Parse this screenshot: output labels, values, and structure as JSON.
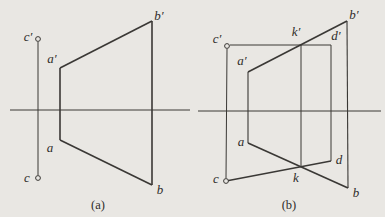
{
  "background": "#e9e7e3",
  "ink": "#3a3835",
  "figures": {
    "a": {
      "caption": "(a)",
      "lines": [
        {
          "name": "axis-x",
          "x1": 10,
          "y1": 110,
          "x2": 190,
          "y2": 110,
          "w": 1
        },
        {
          "name": "projection-line-c-c-prime",
          "x1": 38,
          "y1": 42,
          "x2": 38,
          "y2": 175,
          "w": 1
        },
        {
          "name": "edge-a-prime-b-prime",
          "x1": 60,
          "y1": 68,
          "x2": 152,
          "y2": 21,
          "w": 1.6
        },
        {
          "name": "edge-b-prime-b",
          "x1": 152,
          "y1": 21,
          "x2": 152,
          "y2": 185,
          "w": 1.6
        },
        {
          "name": "edge-a-b",
          "x1": 60,
          "y1": 140,
          "x2": 152,
          "y2": 185,
          "w": 1.6
        },
        {
          "name": "edge-a-a-prime",
          "x1": 60,
          "y1": 68,
          "x2": 60,
          "y2": 140,
          "w": 1.6
        }
      ],
      "circles": [
        {
          "name": "point-c-prime",
          "cx": 38,
          "cy": 39,
          "r": 2.4
        },
        {
          "name": "point-c",
          "cx": 38,
          "cy": 178,
          "r": 2.4
        }
      ],
      "labels": [
        {
          "name": "label-c-prime",
          "text": "c′",
          "x": 28,
          "y": 36
        },
        {
          "name": "label-a-prime",
          "text": "a′",
          "x": 52,
          "y": 58
        },
        {
          "name": "label-b-prime",
          "text": "b′",
          "x": 159,
          "y": 15
        },
        {
          "name": "label-a",
          "text": "a",
          "x": 50,
          "y": 147
        },
        {
          "name": "label-c",
          "text": "c",
          "x": 27,
          "y": 177
        },
        {
          "name": "label-b",
          "text": "b",
          "x": 160,
          "y": 189
        }
      ]
    },
    "b": {
      "caption": "(b)",
      "lines": [
        {
          "name": "axis-x",
          "x1": 198,
          "y1": 111,
          "x2": 381,
          "y2": 111,
          "w": 1
        },
        {
          "name": "projection-line-c-c-prime",
          "x1": 227,
          "y1": 49,
          "x2": 226,
          "y2": 178,
          "w": 1
        },
        {
          "name": "line-c-prime-d-prime",
          "x1": 230,
          "y1": 45,
          "x2": 331,
          "y2": 45,
          "w": 1
        },
        {
          "name": "edge-a-prime-b-prime",
          "x1": 248,
          "y1": 72,
          "x2": 347,
          "y2": 21,
          "w": 1.6
        },
        {
          "name": "edge-a-b",
          "x1": 248,
          "y1": 143,
          "x2": 348,
          "y2": 188,
          "w": 1.6
        },
        {
          "name": "line-c-d",
          "x1": 226,
          "y1": 181,
          "x2": 331,
          "y2": 161,
          "w": 1.3
        },
        {
          "name": "projection-line-a-a-prime",
          "x1": 248,
          "y1": 72,
          "x2": 248,
          "y2": 143,
          "w": 1.1
        },
        {
          "name": "projection-line-k-k-prime",
          "x1": 301,
          "y1": 45,
          "x2": 301,
          "y2": 167,
          "w": 1
        },
        {
          "name": "projection-line-d-d-prime",
          "x1": 331,
          "y1": 45,
          "x2": 331,
          "y2": 161,
          "w": 1
        },
        {
          "name": "projection-line-b-b-prime",
          "x1": 347,
          "y1": 21,
          "x2": 348,
          "y2": 188,
          "w": 1.1
        }
      ],
      "circles": [
        {
          "name": "point-c-prime",
          "cx": 227,
          "cy": 46,
          "r": 2.4
        },
        {
          "name": "point-c",
          "cx": 226,
          "cy": 181,
          "r": 2.4
        }
      ],
      "labels": [
        {
          "name": "label-c-prime",
          "text": "c′",
          "x": 217,
          "y": 38
        },
        {
          "name": "label-k-prime",
          "text": "k′",
          "x": 296,
          "y": 31
        },
        {
          "name": "label-d-prime",
          "text": "d′",
          "x": 336,
          "y": 35
        },
        {
          "name": "label-b-prime",
          "text": "b′",
          "x": 354,
          "y": 14
        },
        {
          "name": "label-a-prime",
          "text": "a′",
          "x": 242,
          "y": 60
        },
        {
          "name": "label-a",
          "text": "a",
          "x": 241,
          "y": 141
        },
        {
          "name": "label-c",
          "text": "c",
          "x": 216,
          "y": 178
        },
        {
          "name": "label-k",
          "text": "k",
          "x": 296,
          "y": 177
        },
        {
          "name": "label-d",
          "text": "d",
          "x": 339,
          "y": 159
        },
        {
          "name": "label-b",
          "text": "b",
          "x": 356,
          "y": 192
        }
      ]
    }
  }
}
